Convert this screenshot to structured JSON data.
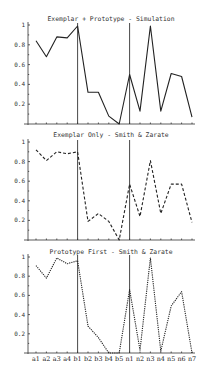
{
  "chart_data": [
    {
      "type": "line",
      "title": "Exemplar + Prototype - Simulation",
      "line_style": "solid",
      "categories": [
        "a1",
        "a2",
        "a3",
        "a4",
        "b1",
        "b2",
        "b3",
        "b4",
        "b5",
        "n1",
        "n2",
        "n3",
        "n4",
        "n5",
        "n6",
        "n7"
      ],
      "values": [
        0.84,
        0.68,
        0.88,
        0.87,
        0.99,
        0.32,
        0.32,
        0.08,
        0.0,
        0.5,
        0.13,
        0.99,
        0.13,
        0.51,
        0.48,
        0.07
      ],
      "vertical_markers": [
        "b1",
        "n1"
      ],
      "ylim": [
        0,
        1
      ],
      "yticks": [
        "0.2",
        "0.4",
        "0.6",
        "0.8",
        "1"
      ],
      "xlabel": "",
      "ylabel": "",
      "show_x_labels": false
    },
    {
      "type": "line",
      "title": "Exemplar Only - Smith & Zarate",
      "line_style": "dashed",
      "categories": [
        "a1",
        "a2",
        "a3",
        "a4",
        "b1",
        "b2",
        "b3",
        "b4",
        "b5",
        "n1",
        "n2",
        "n3",
        "n4",
        "n5",
        "n6",
        "n7"
      ],
      "values": [
        0.92,
        0.81,
        0.9,
        0.88,
        0.9,
        0.19,
        0.27,
        0.19,
        0.0,
        0.57,
        0.24,
        0.81,
        0.27,
        0.57,
        0.57,
        0.18
      ],
      "vertical_markers": [
        "b1",
        "n1"
      ],
      "ylim": [
        0,
        1
      ],
      "yticks": [
        "0.2",
        "0.4",
        "0.6",
        "0.8",
        "1"
      ],
      "xlabel": "",
      "ylabel": "",
      "show_x_labels": false
    },
    {
      "type": "line",
      "title": "Prototype First - Smith & Zarate",
      "line_style": "dotted",
      "categories": [
        "a1",
        "a2",
        "a3",
        "a4",
        "b1",
        "b2",
        "b3",
        "b4",
        "b5",
        "n1",
        "n2",
        "n3",
        "n4",
        "n5",
        "n6",
        "n7"
      ],
      "values": [
        0.91,
        0.78,
        0.99,
        0.93,
        0.96,
        0.28,
        0.16,
        0.0,
        0.0,
        0.66,
        0.03,
        0.99,
        0.02,
        0.49,
        0.64,
        0.0
      ],
      "vertical_markers": [
        "b1",
        "n1"
      ],
      "ylim": [
        0,
        1
      ],
      "yticks": [
        "0.2",
        "0.4",
        "0.6",
        "0.8",
        "1"
      ],
      "xlabel": "",
      "ylabel": "",
      "show_x_labels": true
    }
  ],
  "layout": {
    "panels": [
      {
        "top": 25,
        "bottom": 124,
        "title_y": 21
      },
      {
        "top": 142,
        "bottom": 240,
        "title_y": 137
      },
      {
        "top": 257,
        "bottom": 353,
        "title_y": 254
      }
    ],
    "axis_x": 28,
    "first_x": 36,
    "step_x": 10.4,
    "right_x": 195,
    "line_color": "#222222"
  }
}
